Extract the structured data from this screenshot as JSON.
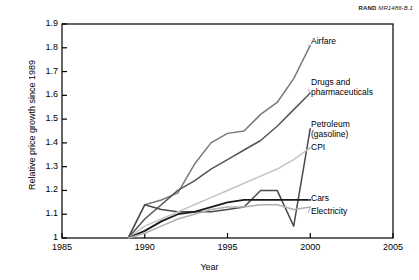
{
  "credit": {
    "org": "RAND",
    "code": "MR1486-B.1"
  },
  "axes": {
    "ylabel": "Relative price growth since 1989",
    "xlabel": "Year",
    "yticks": [
      "1.9",
      "1.8",
      "1.7",
      "1.6",
      "1.5",
      "1.4",
      "1.3",
      "1.2",
      "1.1",
      "1"
    ],
    "xticks": [
      "1985",
      "1990",
      "1995",
      "2000",
      "2005"
    ]
  },
  "labels": {
    "airfare": "Airfare",
    "drugs_line1": "Drugs and",
    "drugs_line2": "pharmaceuticals",
    "petroleum_line1": "Petroleum",
    "petroleum_line2": "(gasoline)",
    "cpi": "CPI",
    "cars": "Cars",
    "electricity": "Electricity"
  },
  "chart_data": {
    "type": "line",
    "title": "",
    "xlabel": "Year",
    "ylabel": "Relative price growth since 1989",
    "xlim": [
      1985,
      2005
    ],
    "ylim": [
      1.0,
      1.9
    ],
    "ytick_values": [
      1.0,
      1.1,
      1.2,
      1.3,
      1.4,
      1.5,
      1.6,
      1.7,
      1.8,
      1.9
    ],
    "xtick_values": [
      1985,
      1990,
      1995,
      2000,
      2005
    ],
    "grid": false,
    "legend": "inline-right-labels",
    "x": [
      1989,
      1990,
      1991,
      1992,
      1993,
      1994,
      1995,
      1996,
      1997,
      1998,
      1999,
      2000
    ],
    "series": [
      {
        "name": "Airfare",
        "color": "#7a7a7a",
        "values": [
          1.0,
          1.14,
          1.16,
          1.19,
          1.31,
          1.4,
          1.44,
          1.45,
          1.52,
          1.57,
          1.67,
          1.81
        ]
      },
      {
        "name": "Drugs and pharmaceuticals",
        "color": "#555555",
        "values": [
          1.0,
          1.08,
          1.14,
          1.2,
          1.24,
          1.29,
          1.33,
          1.37,
          1.41,
          1.47,
          1.54,
          1.61
        ]
      },
      {
        "name": "Petroleum (gasoline)",
        "color": "#4a4a4a",
        "values": [
          1.0,
          1.14,
          1.12,
          1.11,
          1.11,
          1.11,
          1.12,
          1.13,
          1.2,
          1.2,
          1.05,
          1.46
        ]
      },
      {
        "name": "CPI",
        "color": "#c4c4c4",
        "values": [
          1.0,
          1.05,
          1.08,
          1.11,
          1.14,
          1.17,
          1.2,
          1.23,
          1.26,
          1.29,
          1.33,
          1.38
        ]
      },
      {
        "name": "Cars",
        "color": "#1a1a1a",
        "values": [
          1.0,
          1.03,
          1.07,
          1.1,
          1.11,
          1.13,
          1.15,
          1.16,
          1.16,
          1.16,
          1.16,
          1.16
        ]
      },
      {
        "name": "Electricity",
        "color": "#b0b0b0",
        "values": [
          1.0,
          1.02,
          1.05,
          1.08,
          1.1,
          1.12,
          1.13,
          1.13,
          1.14,
          1.14,
          1.12,
          1.13
        ]
      }
    ]
  },
  "plot_geometry": {
    "left": 62,
    "right": 393,
    "top": 24,
    "bottom": 238
  }
}
